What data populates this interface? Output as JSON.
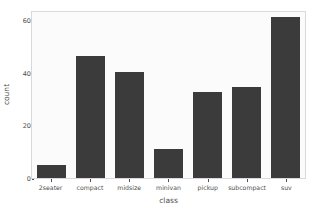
{
  "chart_data": {
    "type": "bar",
    "title": "",
    "subtitle": "",
    "categories": [
      "2seater",
      "compact",
      "midsize",
      "minivan",
      "pickup",
      "subcompact",
      "suv"
    ],
    "values": [
      5,
      47,
      41,
      11,
      33,
      35,
      62
    ],
    "xlabel": "class",
    "ylabel": "count",
    "ylim": [
      0,
      64
    ],
    "yticks": [
      0,
      20,
      40,
      60
    ],
    "ytick_labels": [
      "0",
      "20",
      "40",
      "60"
    ],
    "grid": false,
    "legend": null,
    "annotations": [],
    "colors": {
      "bar_fill": "#3b3b3b",
      "panel_background": "#fbfbfc",
      "panel_border": "#d9d9dd",
      "axis_text": "#4d4d4d",
      "figure_background": "#ffffff"
    }
  }
}
